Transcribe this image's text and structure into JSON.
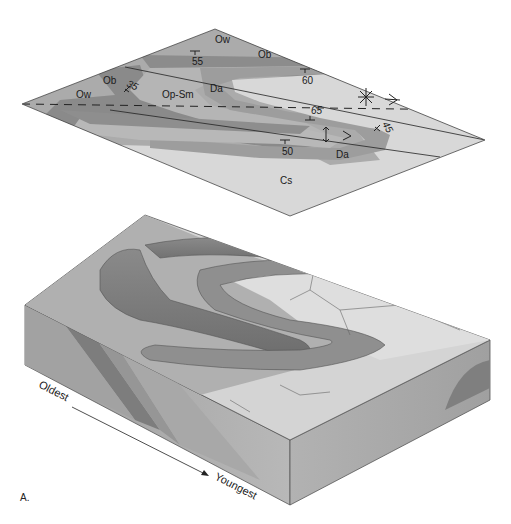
{
  "figure": {
    "panel_label": "A.",
    "map": {
      "units": [
        {
          "code": "Ow",
          "color": "#a9a9a9"
        },
        {
          "code": "Ob",
          "color": "#8a8a8a"
        },
        {
          "code": "Op-Sm",
          "color": "#b3b3b3"
        },
        {
          "code": "Da",
          "color": "#9c9c9c"
        },
        {
          "code": "Cs",
          "color": "#d6d6d6"
        }
      ],
      "labels": {
        "ow_top": "Ow",
        "ob_top": "Ob",
        "ob_left": "Ob",
        "ow_left": "Ow",
        "op_sm": "Op-Sm",
        "da_upper": "Da",
        "da_lower": "Da",
        "cs": "Cs"
      },
      "dips": {
        "d55": "55",
        "d60": "60",
        "d35": "35",
        "d65": "65",
        "d45": "45",
        "d50": "50"
      }
    },
    "block": {
      "sequence_start": "Oldest",
      "sequence_end": "Youngest"
    }
  }
}
